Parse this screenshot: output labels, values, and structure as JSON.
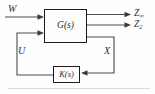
{
  "diagram": {
    "type": "control-block-diagram",
    "blocks": {
      "plant": {
        "label": "G(s)",
        "role": "generalized plant"
      },
      "controller": {
        "label": "K(s)",
        "role": "feedback controller"
      }
    },
    "signals": {
      "exogenous_input": "W",
      "control_input": "U",
      "measurement": "X",
      "output_hinf": {
        "base": "Z",
        "sub": "∞"
      },
      "output_h2": {
        "base": "Z",
        "sub": "2"
      }
    },
    "colors": {
      "background": "#fefefe",
      "line": "#4a4a4a",
      "block_border": "#1c1c1c",
      "text": "#2f2f2f",
      "artifact": "#dcdcdc"
    }
  }
}
